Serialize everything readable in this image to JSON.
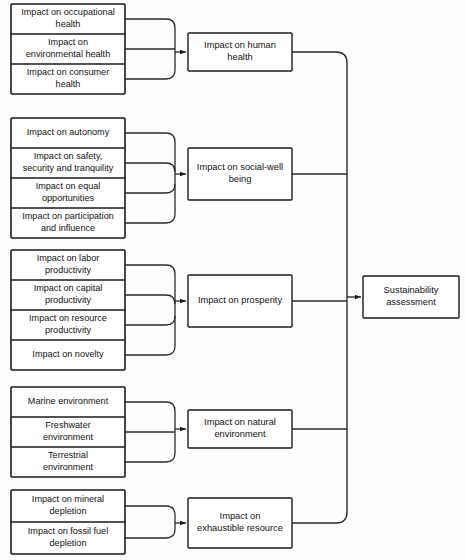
{
  "diagram": {
    "colors": {
      "stroke": "#1a1a1a",
      "connector": "#2a2a2a",
      "background": "#ffffff",
      "text": "#111111"
    },
    "final_node": {
      "label_lines": [
        "Sustainability",
        "assessment"
      ],
      "label": "Sustainability assessment"
    },
    "groups": [
      {
        "id": "human-health",
        "mid_node": {
          "label": "Impact on human health",
          "label_lines": [
            "Impact on human",
            "health"
          ]
        },
        "leaves": [
          {
            "label": "Impact on occupational health",
            "label_lines": [
              "Impact on occupational",
              "health"
            ]
          },
          {
            "label": "Impact on environmental health",
            "label_lines": [
              "Impact on",
              "environmental health"
            ]
          },
          {
            "label": "Impact on consumer health",
            "label_lines": [
              "Impact on consumer",
              "health"
            ]
          }
        ]
      },
      {
        "id": "social-well-being",
        "mid_node": {
          "label": "Impact on social-well being",
          "label_lines": [
            "Impact on social-well",
            "being"
          ]
        },
        "leaves": [
          {
            "label": "Impact on autonomy",
            "label_lines": [
              "Impact on autonomy"
            ]
          },
          {
            "label": "Impact on safety, security and tranquility",
            "label_lines": [
              "Impact on safety,",
              "security and tranquility"
            ]
          },
          {
            "label": "Impact on equal opportunities",
            "label_lines": [
              "Impact on equal",
              "opportunities"
            ]
          },
          {
            "label": "Impact on participation and influence",
            "label_lines": [
              "Impact on participation",
              "and influence"
            ]
          }
        ]
      },
      {
        "id": "prosperity",
        "mid_node": {
          "label": "Impact on prosperity",
          "label_lines": [
            "Impact on prosperity"
          ]
        },
        "leaves": [
          {
            "label": "Impact on labor productivity",
            "label_lines": [
              "Impact on labor",
              "productivity"
            ]
          },
          {
            "label": "Impact on capital productivity",
            "label_lines": [
              "Impact on capital",
              "productivity"
            ]
          },
          {
            "label": "Impact on resource productivity",
            "label_lines": [
              "Impact on resource",
              "productivity"
            ]
          },
          {
            "label": "Impact on novelty",
            "label_lines": [
              "Impact on novelty"
            ]
          }
        ]
      },
      {
        "id": "natural-environment",
        "mid_node": {
          "label": "Impact on natural environment",
          "label_lines": [
            "Impact on natural",
            "environment"
          ]
        },
        "leaves": [
          {
            "label": "Marine environment",
            "label_lines": [
              "Marine environment"
            ]
          },
          {
            "label": "Freshwater environment",
            "label_lines": [
              "Freshwater",
              "environment"
            ]
          },
          {
            "label": "Terrestrial environment",
            "label_lines": [
              "Terrestrial",
              "environment"
            ]
          }
        ]
      },
      {
        "id": "exhaustible-resource",
        "mid_node": {
          "label": "Impact on exhaustible resource",
          "label_lines": [
            "Impact on",
            "exhaustible resource"
          ]
        },
        "leaves": [
          {
            "label": "Impact on mineral depletion",
            "label_lines": [
              "Impact on mineral",
              "depletion"
            ]
          },
          {
            "label": "Impact on fossil fuel depletion",
            "label_lines": [
              "Impact on fossil fuel",
              "depletion"
            ]
          }
        ]
      }
    ]
  },
  "layout": {
    "leaf_x": 11,
    "leaf_w": 114,
    "collector_x": 175,
    "mid_x": 188,
    "mid_w": 104,
    "bus_x": 347,
    "final_x": 363,
    "final_y": 276,
    "final_w": 96,
    "final_h": 42,
    "groups": [
      {
        "leaf_top": 4,
        "leaf_row_h": 30,
        "mid_y": 33,
        "mid_h": 38
      },
      {
        "leaf_top": 118,
        "leaf_row_h": 30,
        "mid_y": 148,
        "mid_h": 52
      },
      {
        "leaf_top": 250,
        "leaf_row_h": 30,
        "mid_y": 275,
        "mid_h": 52
      },
      {
        "leaf_top": 387,
        "leaf_row_h": 30,
        "mid_y": 410,
        "mid_h": 38
      },
      {
        "leaf_top": 490,
        "leaf_row_h": 32,
        "mid_y": 498,
        "mid_h": 50
      }
    ]
  }
}
